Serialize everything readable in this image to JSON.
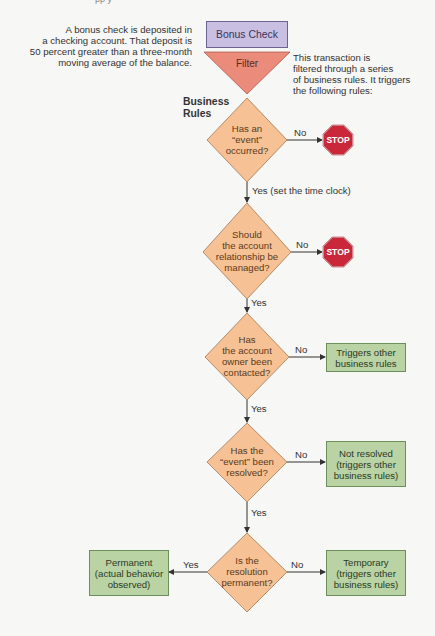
{
  "top_cut_text": "pp y",
  "annotations": {
    "left": [
      "A bonus check is deposited in",
      "a checking account. That deposit is",
      "50 percent greater than a three-month",
      "moving average of the balance."
    ],
    "right": [
      "This transaction is",
      "filtered through a series",
      "of business rules. It triggers",
      "the following rules:"
    ]
  },
  "start_box": {
    "label": "Bonus Check"
  },
  "filter": {
    "label": "Filter"
  },
  "section_label": {
    "line1": "Business",
    "line2": "Rules"
  },
  "decisions": [
    {
      "lines": [
        "Has an",
        "“event”",
        "occurred?"
      ]
    },
    {
      "lines": [
        "Should",
        "the account",
        "relationship be",
        "managed?"
      ]
    },
    {
      "lines": [
        "Has",
        "the account",
        "owner been",
        "contacted?"
      ]
    },
    {
      "lines": [
        "Has the",
        "“event” been",
        "resolved?"
      ]
    },
    {
      "lines": [
        "Is the",
        "resolution",
        "permanent?"
      ]
    }
  ],
  "edge_labels": {
    "d1_no": "No",
    "d1_yes": "Yes (set the time clock)",
    "d2_no": "No",
    "d2_yes": "Yes",
    "d3_no": "No",
    "d3_yes": "Yes",
    "d4_no": "No",
    "d4_yes": "Yes",
    "d5_yes": "Yes",
    "d5_no": "No"
  },
  "stops": [
    {
      "label": "STOP"
    },
    {
      "label": "STOP"
    }
  ],
  "outcomes": {
    "triggers_other": [
      "Triggers other",
      "business rules"
    ],
    "not_resolved": [
      "Not resolved",
      "(triggers other",
      "business rules)"
    ],
    "permanent": [
      "Permanent",
      "(actual behavior",
      "observed)"
    ],
    "temporary": [
      "Temporary",
      "(triggers other",
      "business rules)"
    ]
  },
  "colors": {
    "decision_fill": "#f6c194",
    "decision_stroke": "#a07a55",
    "filter_fill": "#ea8b7b",
    "stop_fill": "#c9283a",
    "outcome_fill": "#b9d3a4",
    "start_fill": "#c9bfe2"
  }
}
